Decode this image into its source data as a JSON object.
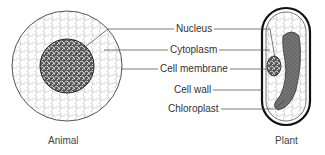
{
  "labels": {
    "nucleus": "Nucleus",
    "cytoplasm": "Cytoplasm",
    "cell_membrane": "Cell membrane",
    "cell_wall": "Cell wall",
    "chloroplast": "Chloroplast"
  },
  "captions": {
    "animal": "Animal",
    "plant": "Plant"
  }
}
